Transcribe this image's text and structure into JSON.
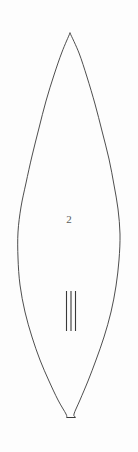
{
  "figure": {
    "name": "lens-outline-figure",
    "background_color": "#fdfdfd",
    "stroke_color": "#3a3a3a",
    "stroke_width": 0.9,
    "canvas": {
      "width": 138,
      "height": 452
    },
    "number_label": "2",
    "number_label_color": "#5a5a5a",
    "apex": {
      "x": 70,
      "y": 33
    },
    "base_tip": {
      "x": 71,
      "y": 417
    },
    "widest": {
      "left_x": 17,
      "right_x": 120,
      "y": 207
    }
  },
  "tally_marks": {
    "name": "three-vertical-tally-marks",
    "count": 3,
    "color": "#3a3a3a",
    "stroke_width": 1.1,
    "top_y": 291,
    "bottom_y": 331,
    "x_positions": [
      66.5,
      71,
      75.5
    ]
  },
  "chart_data": {
    "type": "line",
    "title": "",
    "xlabel": "",
    "ylabel": "",
    "grid": false,
    "legend": null,
    "annotations": [
      {
        "text": "2",
        "x": 70,
        "y": 222
      }
    ],
    "series": [
      {
        "name": "lens-left-edge",
        "closed": false,
        "points": [
          [
            70,
            33
          ],
          [
            62,
            52
          ],
          [
            54,
            75
          ],
          [
            46,
            101
          ],
          [
            39,
            128
          ],
          [
            32,
            156
          ],
          [
            26,
            183
          ],
          [
            21,
            207
          ],
          [
            18,
            232
          ],
          [
            18,
            258
          ],
          [
            20,
            285
          ],
          [
            25,
            312
          ],
          [
            32,
            337
          ],
          [
            40,
            360
          ],
          [
            49,
            381
          ],
          [
            58,
            400
          ],
          [
            66,
            414
          ],
          [
            66.5,
            417
          ]
        ]
      },
      {
        "name": "lens-right-edge",
        "closed": false,
        "points": [
          [
            70,
            33
          ],
          [
            79,
            53
          ],
          [
            87,
            77
          ],
          [
            95,
            104
          ],
          [
            102,
            131
          ],
          [
            109,
            159
          ],
          [
            114,
            185
          ],
          [
            118,
            209
          ],
          [
            120,
            234
          ],
          [
            119,
            260
          ],
          [
            116,
            286
          ],
          [
            111,
            312
          ],
          [
            104,
            337
          ],
          [
            96,
            360
          ],
          [
            88,
            381
          ],
          [
            80,
            400
          ],
          [
            74,
            414
          ],
          [
            75.5,
            417
          ]
        ]
      },
      {
        "name": "lens-base-flat",
        "closed": false,
        "points": [
          [
            66.5,
            417.5
          ],
          [
            75.5,
            417.5
          ]
        ]
      },
      {
        "name": "tally-mark-1",
        "closed": false,
        "points": [
          [
            66.5,
            291
          ],
          [
            66.5,
            331
          ]
        ]
      },
      {
        "name": "tally-mark-2",
        "closed": false,
        "points": [
          [
            71,
            291
          ],
          [
            71,
            331
          ]
        ]
      },
      {
        "name": "tally-mark-3",
        "closed": false,
        "points": [
          [
            75.5,
            291
          ],
          [
            75.5,
            331
          ]
        ]
      }
    ]
  }
}
